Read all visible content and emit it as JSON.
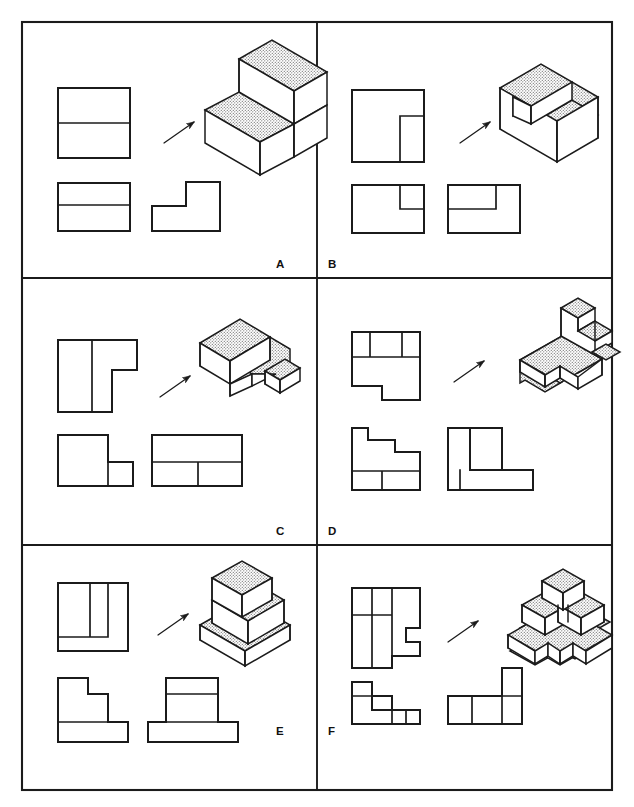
{
  "figure": {
    "sheet_width": 634,
    "sheet_height": 807,
    "background_color": "#ffffff",
    "line_color": "#1b1b1b",
    "stipple_fill_color": "#d8d8d8",
    "panel_count": 6,
    "panel_grid": {
      "columns": 2,
      "rows": 3
    }
  },
  "frame": {
    "outer_left": 22,
    "outer_top": 22,
    "outer_right": 612,
    "outer_bottom": 790,
    "vertical_divider_x": 317,
    "horizontal_divider_y": [
      278,
      545
    ]
  },
  "panels": [
    {
      "id": "A",
      "label": "A",
      "label_position": "bottom-right",
      "row": 0,
      "column": 0,
      "solid_name": "two-step staircase block",
      "isometric": {
        "position": "top-right",
        "shaded_faces": "top",
        "step_count": 2,
        "description": "Rectangular block with two rising steps, top surfaces stippled"
      },
      "arrow": {
        "direction": "up-right",
        "points_to": "isometric"
      },
      "views": [
        {
          "name": "front-view",
          "position": "upper-left",
          "shape": "rectangle split by one horizontal line"
        },
        {
          "name": "top-view",
          "position": "lower-left",
          "shape": "rectangle split by one horizontal line"
        },
        {
          "name": "side-view",
          "position": "lower-right",
          "shape": "L-shaped step profile"
        }
      ]
    },
    {
      "id": "B",
      "label": "B",
      "label_position": "bottom-left",
      "row": 0,
      "column": 1,
      "solid_name": "block with rectangular corner notch",
      "isometric": {
        "position": "top-right",
        "shaded_faces": "top and notch floor",
        "step_count": 1,
        "description": "Cube-like block with a rectangular notch removed from the front right corner"
      },
      "arrow": {
        "direction": "up-right",
        "points_to": "isometric"
      },
      "views": [
        {
          "name": "front-view",
          "position": "upper-left",
          "shape": "square with small inner rectangle at right"
        },
        {
          "name": "top-view",
          "position": "lower-left",
          "shape": "rectangle with small notch box at upper right"
        },
        {
          "name": "side-view",
          "position": "lower-right",
          "shape": "rectangle with notch box at upper left"
        }
      ]
    },
    {
      "id": "C",
      "label": "C",
      "label_position": "bottom-right",
      "row": 1,
      "column": 0,
      "solid_name": "L-shaped block with low shelf",
      "isometric": {
        "position": "top-right",
        "shaded_faces": "top",
        "step_count": 2,
        "description": "Tall rectangular prism with a lower extending shelf and a small end block"
      },
      "arrow": {
        "direction": "up-right",
        "points_to": "isometric"
      },
      "views": [
        {
          "name": "front-view",
          "position": "upper-left",
          "shape": "tall rectangle with stepped T profile"
        },
        {
          "name": "top-view",
          "position": "lower-left",
          "shape": "L-shaped outline with small square"
        },
        {
          "name": "side-view",
          "position": "lower-right",
          "shape": "rectangle divided into upper band and two lower cells"
        }
      ]
    },
    {
      "id": "D",
      "label": "D",
      "label_position": "bottom-left",
      "row": 1,
      "column": 1,
      "solid_name": "base plate with three-step descending stair",
      "isometric": {
        "position": "top-right",
        "shaded_faces": "top of plate and stair treads",
        "step_count": 3,
        "description": "Flat base plate with a tall wall on the right carrying three descending steps"
      },
      "arrow": {
        "direction": "up-right",
        "points_to": "isometric"
      },
      "views": [
        {
          "name": "top-view",
          "position": "upper-left",
          "shape": "square with three cells along top edge and a notch on the bottom"
        },
        {
          "name": "front-view",
          "position": "lower-left",
          "shape": "descending staircase profile with base band"
        },
        {
          "name": "side-view",
          "position": "lower-right",
          "shape": "L-shaped profile with divided vertical leg"
        }
      ]
    },
    {
      "id": "E",
      "label": "E",
      "label_position": "bottom-right",
      "row": 2,
      "column": 0,
      "solid_name": "three-tier stepped pyramid",
      "isometric": {
        "position": "top-right",
        "shaded_faces": "top of each tier",
        "step_count": 3,
        "description": "Wide flat base slab with two progressively smaller blocks stacked and stepped back"
      },
      "arrow": {
        "direction": "up-right",
        "points_to": "isometric"
      },
      "views": [
        {
          "name": "top-view",
          "position": "upper-left",
          "shape": "square with two nested rectangles"
        },
        {
          "name": "front-view",
          "position": "lower-left",
          "shape": "stepped profile with wide base band"
        },
        {
          "name": "side-view",
          "position": "lower-right",
          "shape": "stacked rectangles with wide base band"
        }
      ]
    },
    {
      "id": "F",
      "label": "F",
      "label_position": "bottom-left",
      "row": 2,
      "column": 1,
      "solid_name": "cross-shaped base with stacked cubes",
      "isometric": {
        "position": "top-right",
        "shaded_faces": "top of base and cube tops",
        "step_count": 3,
        "description": "Cruciform low base carrying three cubes, one raised on top of the cluster"
      },
      "arrow": {
        "direction": "up-right",
        "points_to": "isometric"
      },
      "views": [
        {
          "name": "top-view",
          "position": "upper-left",
          "shape": "stepped polygon with cell divisions"
        },
        {
          "name": "front-view",
          "position": "lower-left",
          "shape": "L-shaped cell arrangement"
        },
        {
          "name": "side-view",
          "position": "lower-right",
          "shape": "stepped row of cells with raised block"
        }
      ]
    }
  ]
}
